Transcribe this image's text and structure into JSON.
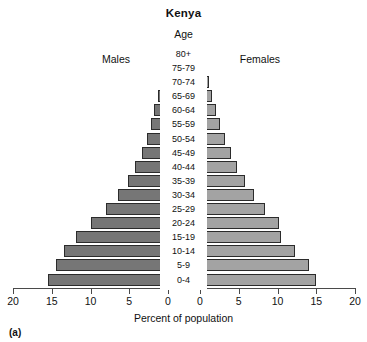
{
  "figure": {
    "caption": "(a)",
    "title": "Kenya",
    "age_header": "Age",
    "left_group_label": "Males",
    "right_group_label": "Females",
    "xlabel": "Percent of population"
  },
  "chart_data": {
    "type": "bar",
    "subtype": "population-pyramid",
    "title": "Kenya",
    "xlabel": "Percent of population",
    "ylabel": "Age",
    "grid": false,
    "legend": [
      "Males",
      "Females"
    ],
    "legend_position": "top-inline",
    "xlim_left": [
      20,
      0
    ],
    "xlim_right": [
      0,
      20
    ],
    "xticks_left": [
      20,
      15,
      10,
      5,
      0
    ],
    "xticks_right": [
      0,
      5,
      10,
      15,
      20
    ],
    "xtick_labels_left": [
      "20",
      "15",
      "10",
      "5",
      "0"
    ],
    "xtick_labels_right": [
      "0",
      "5",
      "10",
      "15",
      "20"
    ],
    "categories": [
      "80+",
      "75-79",
      "70-74",
      "65-69",
      "60-64",
      "55-59",
      "50-54",
      "45-49",
      "40-44",
      "35-39",
      "30-34",
      "25-29",
      "20-24",
      "15-19",
      "10-14",
      "5-9",
      "0-4"
    ],
    "colors": {
      "males": "#767676",
      "females": "#a3a3a3",
      "bar_outline": "#2b2b2b"
    },
    "series": [
      {
        "name": "Males",
        "side": "left",
        "values": [
          0.6,
          0.7,
          1.0,
          1.3,
          1.8,
          2.2,
          2.7,
          3.4,
          4.2,
          5.2,
          6.5,
          8.0,
          9.9,
          11.9,
          13.4,
          14.5,
          15.5
        ]
      },
      {
        "name": "Females",
        "side": "right",
        "values": [
          0.8,
          0.9,
          1.2,
          1.6,
          2.1,
          2.6,
          3.2,
          4.0,
          4.8,
          5.8,
          7.0,
          8.4,
          10.2,
          10.4,
          12.3,
          14.0,
          15.0
        ]
      }
    ],
    "rows": [
      {
        "age": "80+",
        "males": 0.6,
        "females": 0.8
      },
      {
        "age": "75-79",
        "males": 0.7,
        "females": 0.9
      },
      {
        "age": "70-74",
        "males": 1.0,
        "females": 1.2
      },
      {
        "age": "65-69",
        "males": 1.3,
        "females": 1.6
      },
      {
        "age": "60-64",
        "males": 1.8,
        "females": 2.1
      },
      {
        "age": "55-59",
        "males": 2.2,
        "females": 2.6
      },
      {
        "age": "50-54",
        "males": 2.7,
        "females": 3.2
      },
      {
        "age": "45-49",
        "males": 3.4,
        "females": 4.0
      },
      {
        "age": "40-44",
        "males": 4.2,
        "females": 4.8
      },
      {
        "age": "35-39",
        "males": 5.2,
        "females": 5.8
      },
      {
        "age": "30-34",
        "males": 6.5,
        "females": 7.0
      },
      {
        "age": "25-29",
        "males": 8.0,
        "females": 8.4
      },
      {
        "age": "20-24",
        "males": 9.9,
        "females": 10.2
      },
      {
        "age": "15-19",
        "males": 11.9,
        "females": 10.4
      },
      {
        "age": "10-14",
        "males": 13.4,
        "females": 12.3
      },
      {
        "age": "5-9",
        "males": 14.5,
        "females": 14.0
      },
      {
        "age": "0-4",
        "males": 15.5,
        "females": 15.0
      }
    ]
  }
}
